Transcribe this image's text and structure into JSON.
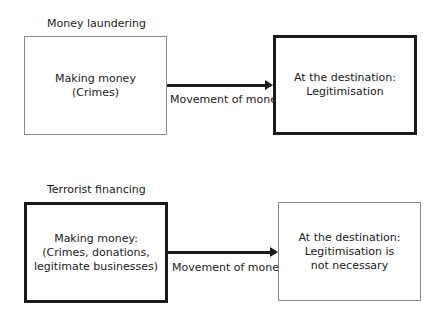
{
  "sections": [
    {
      "title": "Money laundering",
      "source_box": "Making money\n(Crimes)",
      "arrow_label": "Movement of money",
      "destination_box": "At the destination:\nLegitimisation"
    },
    {
      "title": "Terrorist financing",
      "source_box": "Making money:\n(Crimes, donations,\nlegitimate businesses)",
      "arrow_label": "Movement of money",
      "destination_box": "At the destination:\nLegitimisation is\nnot necessary"
    }
  ]
}
